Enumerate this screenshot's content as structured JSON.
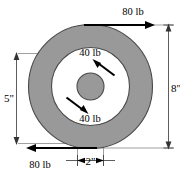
{
  "figure": {
    "shape": "concentric circles",
    "fill_color": "#999999",
    "background_color": "#ffffff",
    "outline_color": "#4a4a4a"
  },
  "forces": {
    "top": {
      "label": "80 lb",
      "magnitude": 80,
      "unit": "lb",
      "direction": "right",
      "applied_at": "outer rim top"
    },
    "bottom": {
      "label": "80 lb",
      "magnitude": 80,
      "unit": "lb",
      "direction": "left",
      "applied_at": "outer rim bottom"
    },
    "inner_upper": {
      "label": "40 lb",
      "magnitude": 40,
      "unit": "lb",
      "direction": "up-left",
      "applied_at": "hub upper right"
    },
    "inner_lower": {
      "label": "40 lb",
      "magnitude": 40,
      "unit": "lb",
      "direction": "down-right",
      "applied_at": "hub lower left"
    }
  },
  "dimensions": {
    "left": {
      "label": "5\"",
      "value": 5,
      "unit": "in",
      "orientation": "vertical",
      "measures": "inner bore diameter"
    },
    "right": {
      "label": "8\"",
      "value": 8,
      "unit": "in",
      "orientation": "vertical",
      "measures": "outer diameter"
    },
    "bottom": {
      "label": "2\"",
      "value": 2,
      "unit": "in",
      "orientation": "horizontal",
      "measures": "hub diameter"
    }
  }
}
